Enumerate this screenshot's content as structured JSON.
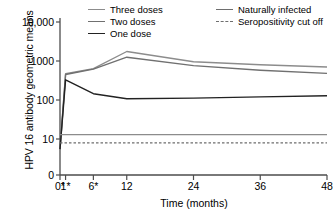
{
  "chart_data": {
    "type": "line",
    "title": "",
    "xlabel": "Time (months)",
    "ylabel": "HPV 16 antibody geometric means",
    "yscale": "log",
    "ylim": [
      3,
      10000
    ],
    "xlim": [
      0,
      48
    ],
    "grid": false,
    "legend_position": "top",
    "x": [
      0,
      1,
      6,
      12,
      24,
      36,
      48
    ],
    "xticklabels": [
      "0*",
      "1*",
      "6*",
      "12",
      "24",
      "36",
      "48"
    ],
    "yticklabels": [
      "10,000",
      "1000",
      "100",
      "10",
      "0"
    ],
    "yticks": [
      10000,
      1000,
      100,
      10,
      0
    ],
    "series": [
      {
        "name": "Three doses",
        "color": "#8c8c8c",
        "style": "solid",
        "width": 1.4,
        "values": [
          5.5,
          470,
          640,
          1750,
          960,
          800,
          700
        ]
      },
      {
        "name": "Two doses",
        "color": "#707070",
        "style": "solid",
        "width": 1.4,
        "values": [
          5.5,
          450,
          620,
          1250,
          760,
          580,
          480
        ]
      },
      {
        "name": "One dose",
        "color": "#222222",
        "style": "solid",
        "width": 1.4,
        "values": [
          5.5,
          330,
          145,
          108,
          112,
          120,
          128
        ]
      },
      {
        "name": "Naturally infected",
        "color": "#8c8c8c",
        "style": "solid",
        "width": 1.3,
        "values": [
          13,
          13,
          13,
          13,
          13,
          13,
          13
        ]
      },
      {
        "name": "Seropositivity cut off",
        "color": "#6e6e6e",
        "style": "dashed",
        "width": 1.2,
        "values": [
          8,
          8,
          8,
          8,
          8,
          8,
          8
        ]
      }
    ]
  },
  "legend": {
    "items": [
      {
        "label": "Three doses",
        "color": "#8c8c8c",
        "style": "solid"
      },
      {
        "label": "Two doses",
        "color": "#707070",
        "style": "solid"
      },
      {
        "label": "One dose",
        "color": "#222222",
        "style": "solid"
      },
      {
        "label": "Naturally infected",
        "color": "#6e6e6e",
        "style": "solid"
      },
      {
        "label": "Seropositivity cut off",
        "color": "#6e6e6e",
        "style": "dashed"
      }
    ]
  },
  "axes": {
    "x_title": "Time (months)",
    "y_title": "HPV 16 antibody geometric means",
    "axis_color": "#4d4d4d"
  }
}
